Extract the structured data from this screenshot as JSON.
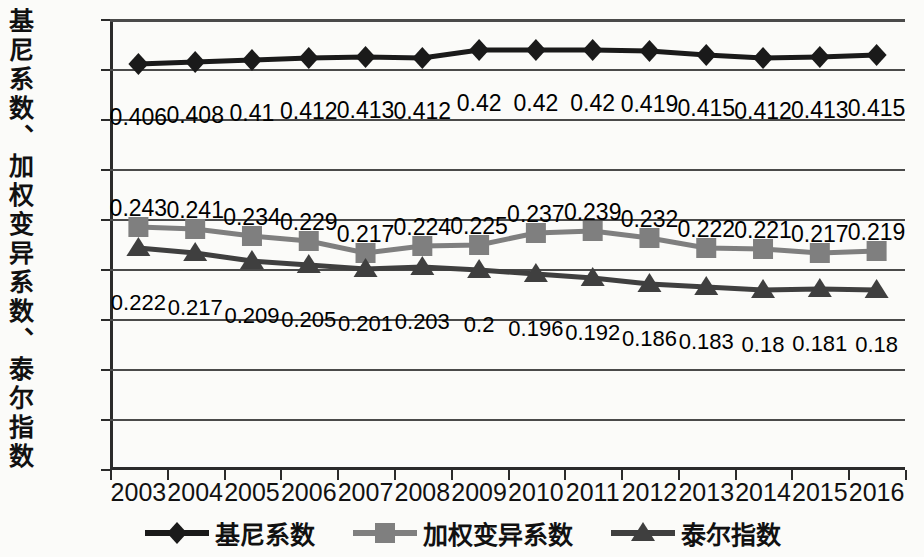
{
  "chart_data": {
    "type": "line",
    "title": "",
    "xlabel": "",
    "ylabel": "基尼系数、加权变异系数、泰尔指数",
    "ylim": [
      0,
      0.45
    ],
    "ytick_labels": [
      "0",
      "0.05",
      "0.1",
      "0.15",
      "0.2",
      "0.25",
      "0.3",
      "0.35",
      "0.4",
      "0.45"
    ],
    "ytick_values": [
      0,
      0.05,
      0.1,
      0.15,
      0.2,
      0.25,
      0.3,
      0.35,
      0.4,
      0.45
    ],
    "grid": true,
    "legend_position": "bottom",
    "categories": [
      "2003",
      "2004",
      "2005",
      "2006",
      "2007",
      "2008",
      "2009",
      "2010",
      "2011",
      "2012",
      "2013",
      "2014",
      "2015",
      "2016"
    ],
    "x": [
      2003,
      2004,
      2005,
      2006,
      2007,
      2008,
      2009,
      2010,
      2011,
      2012,
      2013,
      2014,
      2015,
      2016
    ],
    "series": [
      {
        "name": "基尼系数",
        "marker": "diamond",
        "color": "#1a1a1a",
        "values": [
          0.406,
          0.408,
          0.41,
          0.412,
          0.413,
          0.412,
          0.42,
          0.42,
          0.42,
          0.419,
          0.415,
          0.412,
          0.413,
          0.415
        ],
        "labels": [
          "0.406",
          "0.408",
          "0.41",
          "0.412",
          "0.413",
          "0.412",
          "0.42",
          "0.42",
          "0.42",
          "0.419",
          "0.415",
          "0.412",
          "0.413",
          "0.415"
        ]
      },
      {
        "name": "加权变异系数",
        "marker": "square",
        "color": "#7f7f7f",
        "values": [
          0.243,
          0.241,
          0.234,
          0.229,
          0.217,
          0.224,
          0.225,
          0.237,
          0.239,
          0.232,
          0.222,
          0.221,
          0.217,
          0.219
        ],
        "labels": [
          "0.243",
          "0.241",
          "0.234",
          "0.229",
          "0.217",
          "0.224",
          "0.225",
          "0.237",
          "0.239",
          "0.232",
          "0.222",
          "0.221",
          "0.217",
          "0.219"
        ]
      },
      {
        "name": "泰尔指数",
        "marker": "triangle",
        "color": "#3f3f3f",
        "values": [
          0.222,
          0.217,
          0.209,
          0.205,
          0.201,
          0.203,
          0.2,
          0.196,
          0.192,
          0.186,
          0.183,
          0.18,
          0.181,
          0.18
        ],
        "labels": [
          "0.222",
          "0.217",
          "0.209",
          "0.205",
          "0.201",
          "0.203",
          "0.2",
          "0.196",
          "0.192",
          "0.186",
          "0.183",
          "0.18",
          "0.181",
          "0.18"
        ]
      }
    ]
  }
}
